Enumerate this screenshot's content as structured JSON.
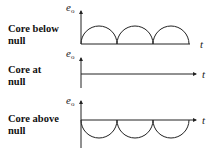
{
  "panels": [
    {
      "label_line1": "Core below",
      "label_line2": "null",
      "y_axis": "e",
      "y_sub": "o",
      "x_axis": "t",
      "waveform": "rectified-positive-arches",
      "cycles": 3
    },
    {
      "label_line1": "Core at",
      "label_line2": "null",
      "y_axis": "e",
      "y_sub": "o",
      "x_axis": "t",
      "waveform": "zero-flat-line",
      "cycles": 0
    },
    {
      "label_line1": "Core above",
      "label_line2": "null",
      "y_axis": "e",
      "y_sub": "o",
      "x_axis": "t",
      "waveform": "rectified-negative-arches",
      "cycles": 3
    }
  ],
  "colors": {
    "stroke": "#222222",
    "background": "#ffffff"
  }
}
